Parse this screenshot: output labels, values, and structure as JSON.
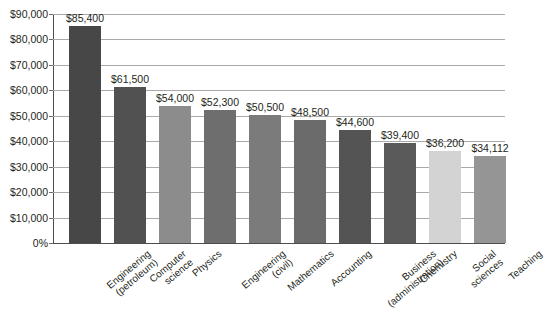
{
  "chart_data": {
    "type": "bar",
    "title": "",
    "subtitle": "",
    "xlabel": "",
    "ylabel": "",
    "ylim": [
      0,
      90000
    ],
    "grid": true,
    "legend": null,
    "y_tick_labels": [
      "$90,000",
      "$80,000",
      "$70,000",
      "$60,000",
      "$50,000",
      "$40,000",
      "$30,000",
      "$20,000",
      "$10,000",
      "0%"
    ],
    "y_tick_values": [
      90000,
      80000,
      70000,
      60000,
      50000,
      40000,
      30000,
      20000,
      10000,
      0
    ],
    "categories": [
      "Engineering (petroleum)",
      "Computer science",
      "Physics",
      "Engineering (civil)",
      "Mathematics",
      "Accounting",
      "Business (administration)",
      "Chemistry",
      "Social sciences",
      "Teaching"
    ],
    "values": [
      85400,
      61500,
      54000,
      52300,
      50500,
      48500,
      44600,
      39400,
      36200,
      34112
    ],
    "data_labels": [
      "$85,400",
      "$61,500",
      "$54,000",
      "$52,300",
      "$50,500",
      "$48,500",
      "$44,600",
      "$39,400",
      "$36,200",
      "$34,112"
    ],
    "bar_colors": [
      "#474747",
      "#515151",
      "#8c8c8c",
      "#6e6e6e",
      "#7b7b7b",
      "#6b6b6b",
      "#545454",
      "#5a5a5a",
      "#d3d3d3",
      "#959595"
    ]
  },
  "axis": {
    "grid_color": "#a9a9a9",
    "axis_color": "#4d4d4d",
    "text_color": "#231f20"
  },
  "category_lines": [
    [
      "Engineering",
      "(petroleum)"
    ],
    [
      "Computer",
      "science"
    ],
    [
      "Physics",
      ""
    ],
    [
      "Engineering",
      "(civil)"
    ],
    [
      "Mathematics",
      ""
    ],
    [
      "Accounting",
      ""
    ],
    [
      "Business",
      "(administration)"
    ],
    [
      "Chemistry",
      ""
    ],
    [
      "Social",
      "sciences"
    ],
    [
      "Teaching",
      ""
    ]
  ]
}
